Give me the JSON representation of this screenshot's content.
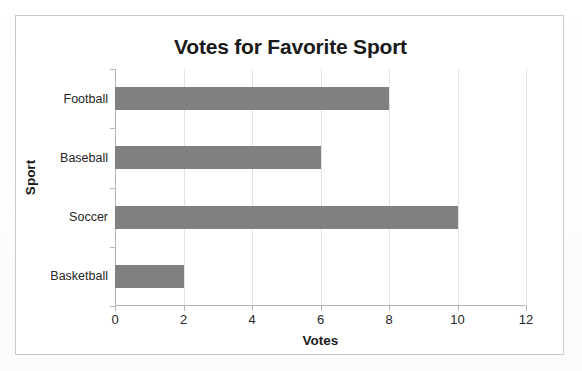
{
  "chart_data": {
    "type": "bar",
    "orientation": "horizontal",
    "title": "Votes for Favorite Sport",
    "xlabel": "Votes",
    "ylabel": "Sport",
    "categories": [
      "Basketball",
      "Soccer",
      "Baseball",
      "Football"
    ],
    "values": [
      2,
      10,
      6,
      8
    ],
    "xlim": [
      0,
      12
    ],
    "xticks": [
      0,
      2,
      4,
      6,
      8,
      10,
      12
    ],
    "xtick_labels": [
      "0",
      "2",
      "4",
      "6",
      "8",
      "10",
      "12"
    ],
    "grid": "vertical",
    "legend": "none",
    "bar_color": "#808080",
    "gridline_color": "#e2e2e2",
    "axis_color": "#b5b5b5",
    "text_color": "#1a1a1a",
    "background": "#ffffff",
    "border_color": "#c9c9c9"
  }
}
